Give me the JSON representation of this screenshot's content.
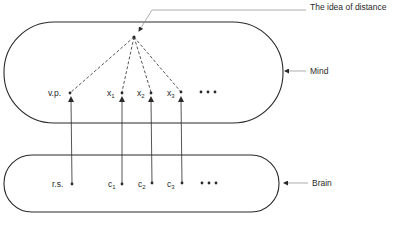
{
  "diagram": {
    "title_annotation": "The idea of distance",
    "regions": [
      {
        "id": "mind",
        "label": "Mind"
      },
      {
        "id": "brain",
        "label": "Brain"
      }
    ],
    "mind_points": [
      {
        "base": "v.p.",
        "sub": ""
      },
      {
        "base": "x",
        "sub": "1"
      },
      {
        "base": "x",
        "sub": "2"
      },
      {
        "base": "x",
        "sub": "3"
      }
    ],
    "brain_points": [
      {
        "base": "r.s.",
        "sub": ""
      },
      {
        "base": "c",
        "sub": "1"
      },
      {
        "base": "c",
        "sub": "2"
      },
      {
        "base": "c",
        "sub": "3"
      }
    ],
    "ellipsis": "•••",
    "connections": [
      {
        "from": "r.s.",
        "to": "v.p.",
        "style": "solid-arrow"
      },
      {
        "from": "c1",
        "to": "x1",
        "style": "solid-arrow"
      },
      {
        "from": "c2",
        "to": "x2",
        "style": "solid-arrow"
      },
      {
        "from": "c3",
        "to": "x3",
        "style": "solid-arrow"
      },
      {
        "from": "idea",
        "to": "v.p.",
        "style": "dashed"
      },
      {
        "from": "idea",
        "to": "x1",
        "style": "dashed"
      },
      {
        "from": "idea",
        "to": "x2",
        "style": "dashed"
      },
      {
        "from": "idea",
        "to": "x3",
        "style": "dashed"
      }
    ],
    "colors": {
      "stroke": "#2a2a2a",
      "leader": "#8a8a8a"
    }
  }
}
